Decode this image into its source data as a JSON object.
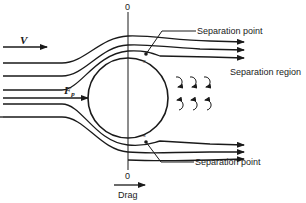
{
  "diagram": {
    "labels": {
      "velocity": "V",
      "pressure_force": "F",
      "pressure_force_sub": "p",
      "separation_point_top": "Separation point",
      "separation_point_bottom": "Separation point",
      "separation_region": "Separation region",
      "separation_marker_top": "s",
      "separation_marker_bottom": "s",
      "axis_top_zero": "0",
      "axis_bottom_zero": "0",
      "drag": "Drag"
    },
    "colors": {
      "ink": "#1a1a1a",
      "background": "#ffffff"
    },
    "elements": {
      "cylinder": "circle",
      "streamlines_upper": 3,
      "streamlines_lower": 2,
      "streamlines_wake_upper": 3,
      "streamlines_wake_lower": 3,
      "eddies_top_row": 3,
      "eddies_bottom_row": 3
    }
  }
}
